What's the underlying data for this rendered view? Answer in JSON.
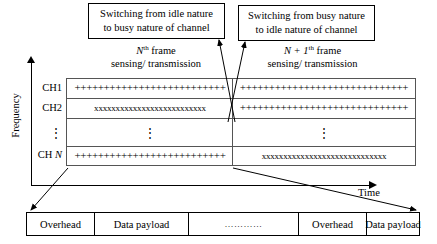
{
  "callouts": {
    "left": {
      "line1": "Switching from idle nature",
      "line2": "to busy nature of channel"
    },
    "right": {
      "line1": "Switching from busy nature",
      "line2": "to idle nature of channel"
    }
  },
  "frames": {
    "left": {
      "label_prefix": "N",
      "label_sup": "th",
      "label_suffix": " frame",
      "sub": "sensing/ transmission"
    },
    "right": {
      "label_prefix": "N + 1",
      "label_sup": "th",
      "label_suffix": " frame",
      "sub": "sensing/ transmission"
    }
  },
  "axes": {
    "y_label": "Frequency",
    "x_label": "Time"
  },
  "channels": {
    "labels": [
      "CH1",
      "CH2",
      "⋮",
      "CH N"
    ],
    "rows": [
      {
        "name": "CH1",
        "left": "++++++++++++++++++++++++++",
        "right": "+++++++++++++++++++++++++++++"
      },
      {
        "name": "CH2",
        "left": "xxxxxxxxxxxxxxxxxxxxxxxxxx",
        "right": "+++++++++++++++++++++++++++++"
      },
      {
        "name": "dots",
        "left": "⋮",
        "right": "⋮"
      },
      {
        "name": "CHN",
        "left": "++++++++++++++++++++++++++",
        "right": "xxxxxxxxxxxxxxxxxxxxxxxxxxxxx"
      }
    ]
  },
  "frame_structure": {
    "cells": [
      "Overhead",
      "Data payload",
      "…………",
      "Overhead",
      "Data payload"
    ]
  },
  "colors": {
    "line": "#000000",
    "grid_line": "#555555",
    "background": "#ffffff"
  }
}
